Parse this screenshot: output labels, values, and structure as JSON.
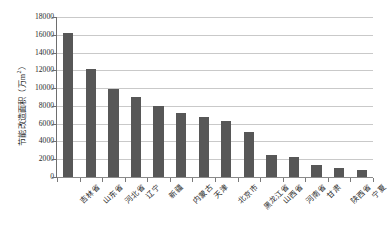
{
  "chart_data": {
    "type": "bar",
    "title": "",
    "subtitle": "",
    "xlabel": "",
    "ylabel": "节能改造面积（万m²）",
    "ylabel_main": "节能改造面积（万m",
    "ylabel_sup": "2",
    "ylabel_tail": "）",
    "categories": [
      "吉林省",
      "山东省",
      "河北省",
      "辽宁",
      "新疆",
      "内蒙古",
      "天津",
      "北京市",
      "黑龙江省",
      "山西省",
      "河南省",
      "甘肃",
      "陕西省",
      "宁夏"
    ],
    "values": [
      16200,
      12100,
      9900,
      9000,
      8000,
      7200,
      6750,
      6300,
      5050,
      2500,
      2300,
      1400,
      1050,
      820
    ],
    "ylim": [
      0,
      18000
    ],
    "ytick_step": 2000,
    "yticks": [
      0,
      2000,
      4000,
      6000,
      8000,
      10000,
      12000,
      14000,
      16000,
      18000
    ],
    "ytick_labels": [
      "0",
      "2000",
      "4000",
      "6000",
      "8000",
      "10000",
      "12000",
      "14000",
      "16000",
      "18000"
    ],
    "grid": true,
    "grid_axis": "y",
    "legend": false,
    "legend_position": "none",
    "series": [
      {
        "name": "节能改造面积",
        "color": "#575757",
        "values": [
          16200,
          12100,
          9900,
          9000,
          8000,
          7200,
          6750,
          6300,
          5050,
          2500,
          2300,
          1400,
          1050,
          820
        ]
      }
    ]
  },
  "colors": {
    "bar": "#575757",
    "gridline": "#c9c9c9",
    "axis": "#6e6e6e",
    "text": "#2b2b2b",
    "background": "#ffffff"
  }
}
